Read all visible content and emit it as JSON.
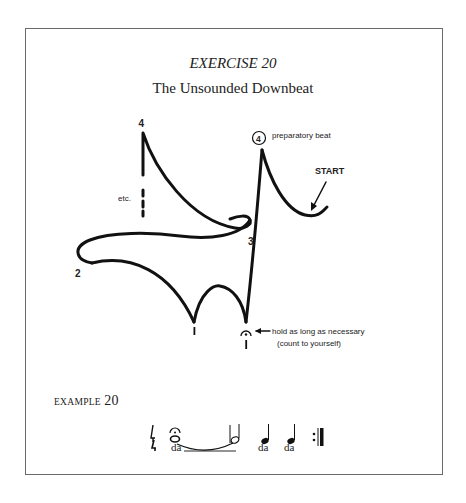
{
  "exercise": {
    "title": "EXERCISE 20",
    "subtitle": "The Unsounded Downbeat"
  },
  "diagram": {
    "labels": {
      "beat_4_top": "4",
      "etc": "etc.",
      "beat_2": "2",
      "beat_3": "3",
      "beat_1_a": "1",
      "beat_1_b": "1",
      "prep_beat_number": "4",
      "prep_beat_text": "preparatory beat",
      "start": "START",
      "hold_note_line1": "hold as long as necessary",
      "hold_note_line2": "(count to yourself)"
    }
  },
  "example": {
    "label_prefix": "EXAMPLE",
    "label_number": "20",
    "time_signature": "4/4",
    "notes": [
      "whole note with fermata tied to half note",
      "quarter note",
      "quarter note"
    ],
    "lyrics": [
      "da",
      "da",
      "da"
    ],
    "end_mark": "repeat sign"
  },
  "colors": {
    "ink": "#111111",
    "frame": "#6a6a6a",
    "background": "#ffffff"
  }
}
